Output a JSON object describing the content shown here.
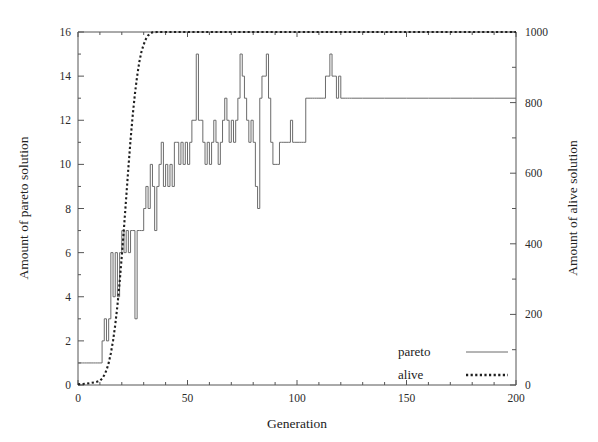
{
  "chart_data": {
    "type": "line",
    "title": "",
    "xlabel": "Generation",
    "ylabel": "Amount of pareto solution",
    "y2label": "Amount of alive solution",
    "xlim": [
      0,
      200
    ],
    "ylim": [
      0,
      16
    ],
    "y2lim": [
      0,
      1000
    ],
    "grid": false,
    "legend_position": "bottom-right",
    "xticks": [
      0,
      50,
      100,
      150,
      200
    ],
    "xtick_labels": [
      "0",
      "50",
      "100",
      "150",
      "200"
    ],
    "yticks": [
      0,
      2,
      4,
      6,
      8,
      10,
      12,
      14,
      16
    ],
    "ytick_labels": [
      "0",
      "2",
      "4",
      "6",
      "8",
      "10",
      "12",
      "14",
      "16"
    ],
    "y2ticks": [
      0,
      200,
      400,
      600,
      800,
      1000
    ],
    "y2tick_labels": [
      "0",
      "200",
      "400",
      "600",
      "800",
      "1000"
    ],
    "y2_minor_ticks": [
      100,
      300,
      500,
      700,
      900
    ],
    "series": [
      {
        "name": "pareto",
        "axis": "left",
        "style": "solid",
        "color": "#6b6b6b",
        "x": [
          0,
          1,
          2,
          3,
          4,
          5,
          6,
          7,
          8,
          9,
          10,
          11,
          12,
          13,
          14,
          15,
          16,
          17,
          18,
          19,
          20,
          21,
          22,
          23,
          24,
          25,
          26,
          27,
          28,
          29,
          30,
          31,
          32,
          33,
          34,
          35,
          36,
          37,
          38,
          39,
          40,
          41,
          42,
          43,
          44,
          45,
          46,
          47,
          48,
          49,
          50,
          51,
          52,
          53,
          54,
          55,
          56,
          57,
          58,
          59,
          60,
          61,
          62,
          63,
          64,
          65,
          66,
          67,
          68,
          69,
          70,
          71,
          72,
          73,
          74,
          75,
          76,
          77,
          78,
          79,
          80,
          81,
          82,
          83,
          84,
          85,
          86,
          87,
          88,
          89,
          90,
          91,
          92,
          93,
          94,
          95,
          96,
          97,
          98,
          99,
          100,
          101,
          102,
          103,
          104,
          105,
          106,
          107,
          108,
          109,
          110,
          111,
          112,
          113,
          114,
          115,
          116,
          117,
          118,
          119,
          120,
          121,
          122,
          123,
          124,
          125,
          130,
          140,
          150,
          160,
          170,
          180,
          190,
          200
        ],
        "values": [
          1,
          1,
          1,
          1,
          1,
          1,
          1,
          1,
          1,
          1,
          1,
          2,
          3,
          2,
          3,
          6,
          4,
          6,
          4,
          6,
          7,
          6,
          7,
          6,
          7,
          7,
          3,
          7,
          7,
          7,
          8,
          9,
          8,
          10,
          9,
          7,
          9,
          10,
          11,
          9,
          10,
          9,
          10,
          9,
          11,
          11,
          10,
          11,
          10,
          11,
          10,
          11,
          12,
          12,
          15,
          12,
          12,
          11,
          10,
          11,
          10,
          11,
          12,
          11,
          10,
          11,
          12,
          13,
          12,
          11,
          12,
          11,
          12,
          13,
          15,
          14,
          13,
          12,
          11,
          12,
          11,
          9,
          8,
          13,
          14,
          14,
          15,
          13,
          11,
          10,
          10,
          10,
          11,
          11,
          11,
          11,
          11,
          12,
          11,
          11,
          11,
          11,
          11,
          11,
          13,
          13,
          13,
          13,
          13,
          13,
          13,
          13,
          13,
          14,
          14,
          15,
          14,
          14,
          13,
          14,
          13,
          13,
          13,
          13,
          13,
          13,
          13,
          13,
          13,
          13,
          13,
          13,
          13,
          13
        ]
      },
      {
        "name": "alive",
        "axis": "right",
        "style": "dotted",
        "color": "#1f1f1f",
        "x": [
          0,
          2,
          4,
          6,
          8,
          10,
          11,
          12,
          13,
          14,
          15,
          16,
          17,
          18,
          19,
          20,
          21,
          22,
          23,
          24,
          25,
          26,
          27,
          28,
          29,
          30,
          31,
          32,
          33,
          34,
          36,
          40,
          50,
          60,
          80,
          100,
          120,
          140,
          160,
          180,
          200
        ],
        "values": [
          2,
          3,
          4,
          6,
          8,
          12,
          18,
          28,
          42,
          62,
          90,
          125,
          170,
          225,
          290,
          365,
          445,
          530,
          615,
          695,
          765,
          825,
          875,
          915,
          945,
          965,
          980,
          990,
          996,
          999,
          1000,
          1000,
          1000,
          1000,
          1000,
          1000,
          1000,
          1000,
          1000,
          1000,
          1000
        ]
      }
    ],
    "legend": [
      {
        "label": "pareto",
        "style": "solid"
      },
      {
        "label": "alive",
        "style": "dotted"
      }
    ]
  },
  "plot_geometry": {
    "left": 78,
    "right": 516,
    "top": 32,
    "bottom": 385
  }
}
